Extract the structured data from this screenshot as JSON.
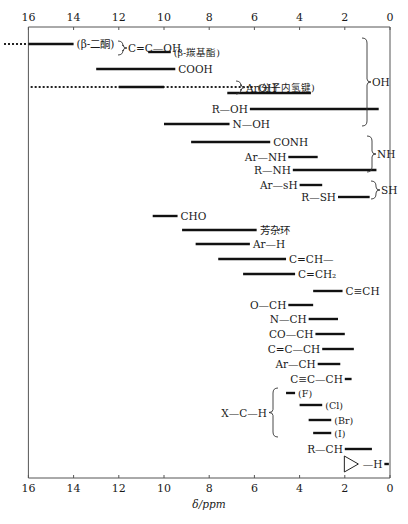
{
  "chart_data": {
    "type": "range-bar",
    "title": "",
    "xlabel": "δ/ppm",
    "ylabel": "",
    "xlim": [
      16,
      0
    ],
    "x_reversed": true,
    "ticks": [
      16,
      14,
      12,
      10,
      8,
      6,
      4,
      2,
      0
    ],
    "grid": false,
    "rows": [
      {
        "label": "(β-二酮)",
        "from": 16,
        "to": 14,
        "y": 44,
        "label_side": "right",
        "dotted_left": true,
        "group": "C=C—OH",
        "font": "lbl"
      },
      {
        "label": "(β-羰基酯)",
        "from": 10.7,
        "to": 9.7,
        "y": 52,
        "label_side": "right",
        "group": "C=C—OH",
        "font": "sm"
      },
      {
        "label": "COOH",
        "from": 13,
        "to": 9.5,
        "y": 69,
        "label_side": "right",
        "group": "OH",
        "font": "lbl"
      },
      {
        "label": "(分子内氢键)",
        "from": 12,
        "to": 10,
        "y": 87,
        "label_side": "right",
        "dotted_from": 15.9,
        "dotted_to": 6.0,
        "group": "ArOH",
        "font": "sm"
      },
      {
        "label": "",
        "from": 7.2,
        "to": 3.5,
        "y": 93,
        "label_side": "none",
        "group": "ArOH"
      },
      {
        "label": "R—OH",
        "from": 6.2,
        "to": 0.5,
        "y": 109,
        "label_side": "left",
        "group": "OH",
        "font": "lbl"
      },
      {
        "label": "N—OH",
        "from": 10,
        "to": 7.1,
        "y": 124,
        "label_side": "right",
        "group": "OH",
        "font": "lbl"
      },
      {
        "label": "CONH",
        "from": 8.8,
        "to": 5.3,
        "y": 142,
        "label_side": "right",
        "group": "NH",
        "font": "lbl"
      },
      {
        "label": "Ar—NH",
        "from": 4.5,
        "to": 3.2,
        "y": 157,
        "label_side": "left",
        "group": "NH",
        "font": "lbl"
      },
      {
        "label": "R—NH",
        "from": 4.3,
        "to": 0.6,
        "y": 170,
        "label_side": "left",
        "group": "NH",
        "font": "lbl"
      },
      {
        "label": "Ar—sH",
        "from": 4.0,
        "to": 3.0,
        "y": 185,
        "label_side": "left",
        "group": "SH",
        "font": "lbl"
      },
      {
        "label": "R—SH",
        "from": 2.3,
        "to": 0.9,
        "y": 197,
        "label_side": "left",
        "group": "SH",
        "font": "lbl"
      },
      {
        "label": "CHO",
        "from": 10.5,
        "to": 9.4,
        "y": 216,
        "label_side": "right",
        "font": "lbl"
      },
      {
        "label": "芳杂环",
        "from": 9.2,
        "to": 5.9,
        "y": 230,
        "label_side": "right",
        "font": "lbl"
      },
      {
        "label": "Ar—H",
        "from": 8.6,
        "to": 6.2,
        "y": 244,
        "label_side": "right",
        "font": "lbl"
      },
      {
        "label": "C=CH—",
        "from": 7.6,
        "to": 4.6,
        "y": 259,
        "label_side": "right",
        "font": "lbl"
      },
      {
        "label": "C=CH₂",
        "from": 6.5,
        "to": 4.2,
        "y": 274,
        "label_side": "right",
        "font": "lbl"
      },
      {
        "label": "C≡CH",
        "from": 3.4,
        "to": 2.1,
        "y": 291,
        "label_side": "right",
        "font": "lbl"
      },
      {
        "label": "O—CH",
        "from": 4.5,
        "to": 3.4,
        "y": 305,
        "label_side": "left",
        "font": "lbl"
      },
      {
        "label": "N—CH",
        "from": 3.6,
        "to": 2.3,
        "y": 319,
        "label_side": "left",
        "font": "lbl"
      },
      {
        "label": "CO—CH",
        "from": 3.3,
        "to": 2.0,
        "y": 334,
        "label_side": "left",
        "font": "lbl"
      },
      {
        "label": "C=C—CH",
        "from": 3.0,
        "to": 1.6,
        "y": 349,
        "label_side": "left",
        "font": "lbl"
      },
      {
        "label": "Ar—CH",
        "from": 3.2,
        "to": 2.2,
        "y": 364,
        "label_side": "left",
        "font": "lbl"
      },
      {
        "label": "C≡C—CH",
        "from": 2.0,
        "to": 1.7,
        "y": 379,
        "label_side": "left",
        "font": "lbl"
      },
      {
        "label": "(F)",
        "from": 4.6,
        "to": 4.2,
        "y": 393,
        "label_side": "right",
        "group": "X—C—H",
        "font": "sm"
      },
      {
        "label": "(Cl)",
        "from": 4.0,
        "to": 3.0,
        "y": 405,
        "label_side": "right",
        "group": "X—C—H",
        "font": "sm"
      },
      {
        "label": "(Br)",
        "from": 3.6,
        "to": 2.6,
        "y": 420,
        "label_side": "right",
        "group": "X—C—H",
        "font": "sm"
      },
      {
        "label": "(I)",
        "from": 3.4,
        "to": 2.6,
        "y": 433,
        "label_side": "right",
        "group": "X—C—H",
        "font": "sm"
      },
      {
        "label": "R—CH",
        "from": 2.0,
        "to": 0.8,
        "y": 449,
        "label_side": "left",
        "font": "lbl"
      },
      {
        "label": "cyclopropane—H",
        "from": 0.25,
        "to": 0.05,
        "y": 464,
        "label_side": "left",
        "font": "lbl"
      }
    ],
    "groups": [
      {
        "label": "C=C—OH",
        "brace_x": 118,
        "y1": 41,
        "y2": 55
      },
      {
        "label": "ArOH",
        "brace_x": 236,
        "y1": 81,
        "y2": 94
      },
      {
        "label": "OH",
        "brace_x": 362,
        "y1": 38,
        "y2": 126
      },
      {
        "label": "NH",
        "brace_x": 367,
        "y1": 136,
        "y2": 172
      },
      {
        "label": "SH",
        "brace_x": 371,
        "y1": 181,
        "y2": 199
      },
      {
        "label": "X—C—H",
        "brace_x": 278,
        "y1": 388,
        "y2": 437
      }
    ]
  },
  "labels": {
    "group_cc_oh": "C=C—OH",
    "group_aroh": "ArOH",
    "group_oh": "OH",
    "group_nh": "NH",
    "group_sh": "SH",
    "group_xch": "X—C—H",
    "cyclopropane_h": "H",
    "xlabel": "δ/ppm"
  }
}
